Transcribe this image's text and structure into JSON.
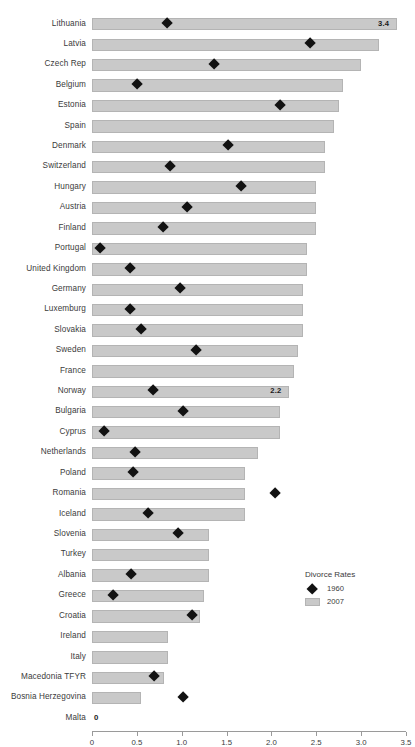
{
  "chart_data": {
    "type": "bar",
    "title": "",
    "xlabel": "",
    "ylabel": "",
    "xlim": [
      0,
      3.5
    ],
    "grid": false,
    "legend_position": "bottom-right",
    "legend_title": "Divorce Rates",
    "series": [
      {
        "name": "1960",
        "marker": "diamond",
        "color": "#121212",
        "values": [
          0.84,
          2.43,
          1.36,
          0.5,
          2.1,
          null,
          1.52,
          0.87,
          1.66,
          1.06,
          0.79,
          0.09,
          0.43,
          0.98,
          0.42,
          0.55,
          1.16,
          null,
          0.68,
          1.02,
          0.13,
          0.48,
          0.46,
          2.04,
          0.62,
          0.96,
          null,
          0.44,
          0.23,
          1.12,
          null,
          null,
          0.69,
          1.02,
          null
        ]
      },
      {
        "name": "2007",
        "marker": "bar",
        "color": "#c9c9c9",
        "values": [
          3.4,
          3.2,
          3.0,
          2.8,
          2.75,
          2.7,
          2.6,
          2.6,
          2.5,
          2.5,
          2.5,
          2.4,
          2.4,
          2.35,
          2.35,
          2.35,
          2.3,
          2.25,
          2.2,
          2.1,
          2.1,
          1.85,
          1.7,
          1.7,
          1.7,
          1.3,
          1.3,
          1.3,
          1.25,
          1.2,
          0.85,
          0.85,
          0.8,
          0.55,
          0.0
        ]
      }
    ],
    "categories": [
      "Lithuania",
      "Latvia",
      "Czech Rep",
      "Belgium",
      "Estonia",
      "Spain",
      "Denmark",
      "Switzerland",
      "Hungary",
      "Austria",
      "Finland",
      "Portugal",
      "United Kingdom",
      "Germany",
      "Luxemburg",
      "Slovakia",
      "Sweden",
      "France",
      "Norway",
      "Bulgaria",
      "Cyprus",
      "Netherlands",
      "Poland",
      "Romania",
      "Iceland",
      "Slovenia",
      "Turkey",
      "Albania",
      "Greece",
      "Croatia",
      "Ireland",
      "Italy",
      "Macedonia TFYR",
      "Bosnia Herzegovina",
      "Malta"
    ],
    "data_labels": [
      {
        "category": "Lithuania",
        "text": "3.4"
      },
      {
        "category": "Norway",
        "text": "2.2"
      },
      {
        "category": "Malta",
        "text": "0"
      }
    ],
    "xticks": [
      0,
      0.5,
      1.0,
      1.5,
      2.0,
      2.5,
      3.0,
      3.5
    ],
    "xtick_labels": [
      "0",
      "0.5",
      "1.0",
      "1.5",
      "2.0",
      "2.5",
      "3.0",
      "3.5"
    ]
  },
  "legend": {
    "title": "Divorce Rates",
    "entries": [
      {
        "label": "1960",
        "marker": "diamond"
      },
      {
        "label": "2007",
        "marker": "swatch"
      }
    ]
  }
}
